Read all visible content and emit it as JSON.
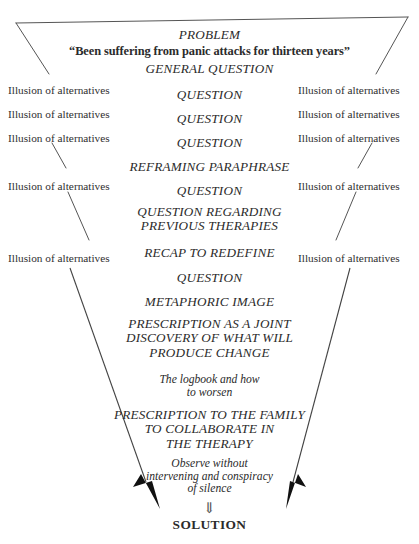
{
  "diagram": {
    "background_color": "#ffffff",
    "line_color": "#555555",
    "text_color": "#2b2b2b",
    "arrow_glyph": "⇓",
    "side_label_text": "Illusion of alternatives",
    "center_steps": [
      {
        "text": "PROBLEM",
        "style": "italic-caps",
        "y": 28
      },
      {
        "text": "“Been suffering from panic attacks for thirteen years”",
        "style": "bold-quote",
        "y": 45,
        "wide": true
      },
      {
        "text": "GENERAL QUESTION",
        "style": "italic-caps",
        "y": 62
      },
      {
        "text": "QUESTION",
        "style": "italic-caps",
        "y": 88
      },
      {
        "text": "QUESTION",
        "style": "italic-caps",
        "y": 112
      },
      {
        "text": "QUESTION",
        "style": "italic-caps",
        "y": 136
      },
      {
        "text": "REFRAMING PARAPHRASE",
        "style": "italic-caps",
        "y": 160
      },
      {
        "text": "QUESTION",
        "style": "italic-caps",
        "y": 184
      },
      {
        "text": "QUESTION REGARDING\nPREVIOUS THERAPIES",
        "style": "italic-caps",
        "y": 205
      },
      {
        "text": "RECAP TO REDEFINE",
        "style": "italic-caps",
        "y": 246
      },
      {
        "text": "QUESTION",
        "style": "italic-caps",
        "y": 271
      },
      {
        "text": "METAPHORIC IMAGE",
        "style": "italic-caps",
        "y": 295
      },
      {
        "text": "PRESCRIPTION AS A JOINT\nDISCOVERY OF WHAT WILL\nPRODUCE CHANGE",
        "style": "italic-caps",
        "y": 317
      },
      {
        "text": "The logbook and how\nto worsen",
        "style": "italic-small",
        "y": 374
      },
      {
        "text": "PRESCRIPTION TO THE FAMILY\nTO COLLABORATE IN\nTHE THERAPY",
        "style": "italic-caps",
        "y": 408,
        "wide": true
      },
      {
        "text": "Observe without\nintervening and conspiracy\nof silence",
        "style": "italic-small",
        "y": 458,
        "wide": true
      },
      {
        "text": "⇓",
        "style": "glyph",
        "y": 500
      },
      {
        "text": "SOLUTION",
        "style": "bold-plain",
        "y": 518
      }
    ],
    "left_labels": [
      {
        "text": "Illusion of alternatives",
        "y": 84
      },
      {
        "text": "Illusion of alternatives",
        "y": 108
      },
      {
        "text": "Illusion of alternatives",
        "y": 132
      },
      {
        "text": "Illusion of alternatives",
        "y": 180
      },
      {
        "text": "Illusion of alternatives",
        "y": 252
      }
    ],
    "right_labels": [
      {
        "text": "Illusion of alternatives",
        "y": 84
      },
      {
        "text": "Illusion of alternatives",
        "y": 108
      },
      {
        "text": "Illusion of alternatives",
        "y": 132
      },
      {
        "text": "Illusion of alternatives",
        "y": 180
      },
      {
        "text": "Illusion of alternatives",
        "y": 252
      }
    ]
  }
}
